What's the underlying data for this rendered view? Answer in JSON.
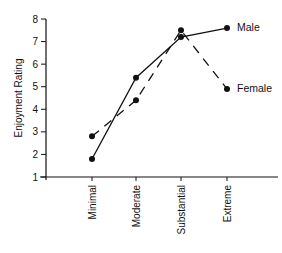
{
  "chart_data": {
    "type": "line",
    "title": "",
    "xlabel": "",
    "ylabel": "Enjoyment Rating",
    "categories": [
      "Minimal",
      "Moderate",
      "Substantial",
      "Extreme"
    ],
    "ylim": [
      1,
      8
    ],
    "yticks": [
      1,
      2,
      3,
      4,
      5,
      6,
      7,
      8
    ],
    "grid": false,
    "legend_position": "inline-right",
    "series": [
      {
        "name": "Male",
        "style": "solid",
        "values": [
          1.8,
          5.4,
          7.2,
          7.6
        ]
      },
      {
        "name": "Female",
        "style": "dashed",
        "values": [
          2.8,
          4.4,
          7.5,
          4.9
        ]
      }
    ]
  },
  "colors": {
    "ink": "#111111",
    "background": "#ffffff"
  }
}
